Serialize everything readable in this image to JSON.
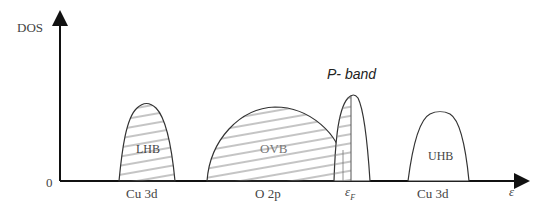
{
  "diagram": {
    "y_axis_label": "DOS",
    "x_axis_label": "ε",
    "origin_label": "0",
    "bands": [
      {
        "name": "LHB",
        "x_label": "Cu 3d",
        "hatched": true
      },
      {
        "name": "OVB",
        "x_label": "O 2p",
        "hatched": true
      },
      {
        "name": "P- band",
        "x_label": "εF",
        "hatched": "partial"
      },
      {
        "name": "UHB",
        "x_label": "Cu 3d",
        "hatched": false
      }
    ],
    "fermi_label_main": "ε",
    "fermi_label_sub": "F",
    "line_color": "#222222",
    "hatch_color": "#888888"
  }
}
